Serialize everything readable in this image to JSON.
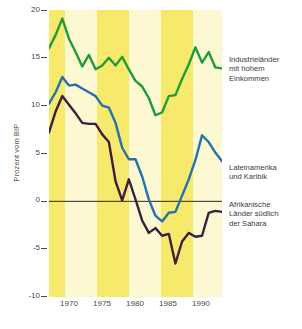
{
  "chart_data": {
    "type": "line",
    "title": "",
    "xlabel": "",
    "ylabel": "Prozent vom BIP",
    "xlim": [
      1967,
      1993
    ],
    "ylim": [
      -10,
      20
    ],
    "xticks": [
      1970,
      1975,
      1980,
      1985,
      1990
    ],
    "yticks": [
      20,
      15,
      10,
      5,
      0,
      -5,
      -10
    ],
    "grid": false,
    "legend_position": "right",
    "zero_line": 0,
    "background_bands": "alternating yellow / pale-cream vertical bands every 2.5 years",
    "series": [
      {
        "name": "Industrieländer mit hohem Einkommen",
        "color": "#1f9b3c",
        "x": [
          1967,
          1968,
          1969,
          1970,
          1971,
          1972,
          1973,
          1974,
          1975,
          1976,
          1977,
          1978,
          1979,
          1980,
          1981,
          1982,
          1983,
          1984,
          1985,
          1986,
          1987,
          1988,
          1989,
          1990,
          1991,
          1992,
          1993
        ],
        "values": [
          16.0,
          17.4,
          19.1,
          17.0,
          15.6,
          14.1,
          15.3,
          13.8,
          14.2,
          15.0,
          14.2,
          15.1,
          13.8,
          12.6,
          12.0,
          10.8,
          9.0,
          9.3,
          11.0,
          11.1,
          12.8,
          14.3,
          16.1,
          14.5,
          15.6,
          14.0,
          13.9
        ]
      },
      {
        "name": "Lateinamerika und Karibik",
        "color": "#2173ae",
        "x": [
          1967,
          1968,
          1969,
          1970,
          1971,
          1972,
          1973,
          1974,
          1975,
          1976,
          1977,
          1978,
          1979,
          1980,
          1981,
          1982,
          1983,
          1984,
          1985,
          1986,
          1987,
          1988,
          1989,
          1990,
          1991,
          1992,
          1993
        ],
        "values": [
          10.2,
          11.4,
          13.0,
          12.1,
          12.2,
          11.8,
          11.4,
          11.0,
          10.0,
          9.8,
          8.2,
          5.6,
          4.4,
          4.4,
          2.6,
          0.2,
          -1.5,
          -2.1,
          -1.2,
          -1.1,
          0.6,
          2.3,
          4.3,
          6.9,
          6.2,
          5.1,
          4.2
        ]
      },
      {
        "name": "Afrikanische Länder südlich der Sahara",
        "color": "#3b1f3f",
        "x": [
          1967,
          1968,
          1969,
          1970,
          1971,
          1972,
          1973,
          1974,
          1975,
          1976,
          1977,
          1978,
          1979,
          1980,
          1981,
          1982,
          1983,
          1984,
          1985,
          1986,
          1987,
          1988,
          1989,
          1990,
          1991,
          1992,
          1993
        ],
        "values": [
          7.2,
          9.4,
          11.0,
          10.1,
          9.2,
          8.2,
          8.1,
          8.1,
          7.0,
          6.2,
          2.1,
          0.1,
          2.3,
          0.2,
          -2.0,
          -3.3,
          -2.8,
          -3.6,
          -3.4,
          -6.5,
          -4.2,
          -3.3,
          -3.7,
          -3.6,
          -1.2,
          -1.0,
          -1.1
        ]
      }
    ]
  },
  "axis": {
    "y_title": "Prozent vom BIP",
    "y_ticklabels": [
      "20",
      "15",
      "10",
      "5",
      "0",
      "-5",
      "-10"
    ],
    "x_ticklabels": [
      "1970",
      "1975",
      "1980",
      "1985",
      "1990"
    ]
  },
  "legend": {
    "industrial": {
      "line1": "Industrieländer",
      "line2": "mit hohem",
      "line3": "Einkommen",
      "color": "#1f9b3c"
    },
    "latam": {
      "line1": "Lateinamerika",
      "line2": "und Karibik",
      "color": "#2173ae"
    },
    "africa": {
      "line1": "Afrikanische",
      "line2": "Länder südlich",
      "line3": "der Sahara",
      "color": "#3b1f3f"
    }
  },
  "colors": {
    "band_dark": "#f7e96b",
    "band_light": "#fcf8d2",
    "axis_text": "#4a4644",
    "zero_line": "#2b2422"
  }
}
